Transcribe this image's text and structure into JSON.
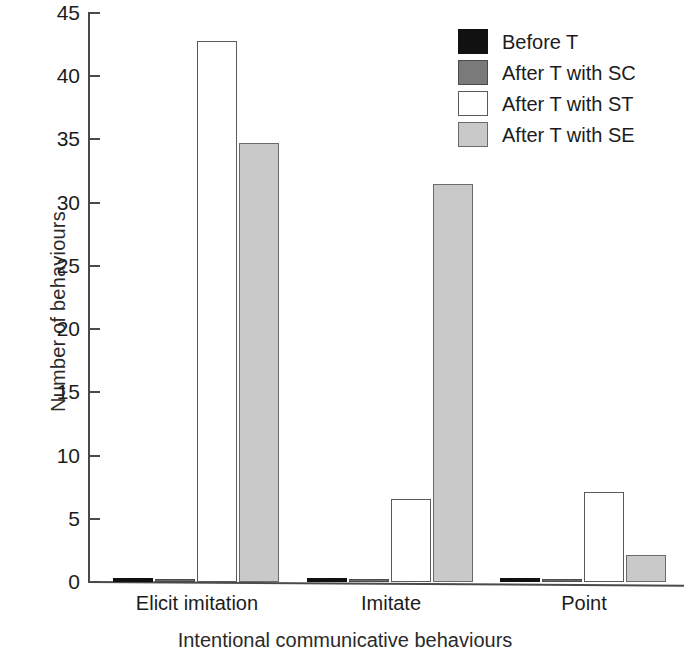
{
  "chart_data": {
    "type": "bar",
    "title": "",
    "xlabel": "Intentional communicative behaviours",
    "ylabel": "Number of behaviours",
    "categories": [
      "Elicit imitation",
      "Imitate",
      "Point"
    ],
    "ylim": [
      0,
      45
    ],
    "yticks": [
      0,
      5,
      10,
      15,
      20,
      25,
      30,
      35,
      40,
      45
    ],
    "ytick_labels": [
      "0",
      "5",
      "10",
      "15",
      "20",
      "25",
      "30",
      "35",
      "40",
      "45"
    ],
    "grid": false,
    "legend_position": "top-right",
    "series": [
      {
        "name": "Before T",
        "key": "s-before",
        "color": "#111111",
        "values": [
          0.3,
          0.3,
          0.3
        ]
      },
      {
        "name": "After T with SC",
        "key": "s-sc",
        "color": "#7a7a7a",
        "values": [
          0.2,
          0.2,
          0.2
        ]
      },
      {
        "name": "After T with ST",
        "key": "s-st",
        "color": "#ffffff",
        "values": [
          42.8,
          6.6,
          7.1
        ]
      },
      {
        "name": "After T with SE",
        "key": "s-se",
        "color": "#c9c9c9",
        "values": [
          34.7,
          31.5,
          2.1
        ]
      }
    ]
  },
  "axis": {
    "y_title": "Number of behaviours",
    "x_title": "Intentional communicative behaviours",
    "ticks": [
      {
        "label": "45"
      },
      {
        "label": "40"
      },
      {
        "label": "35"
      },
      {
        "label": "30"
      },
      {
        "label": "25"
      },
      {
        "label": "20"
      },
      {
        "label": "15"
      },
      {
        "label": "10"
      },
      {
        "label": "5"
      },
      {
        "label": "0"
      }
    ]
  },
  "categories": [
    {
      "label": "Elicit imitation"
    },
    {
      "label": "Imitate"
    },
    {
      "label": "Point"
    }
  ],
  "legend": {
    "items": [
      {
        "label": "Before T"
      },
      {
        "label": "After T with SC"
      },
      {
        "label": "After T with ST"
      },
      {
        "label": "After T with SE"
      }
    ]
  }
}
